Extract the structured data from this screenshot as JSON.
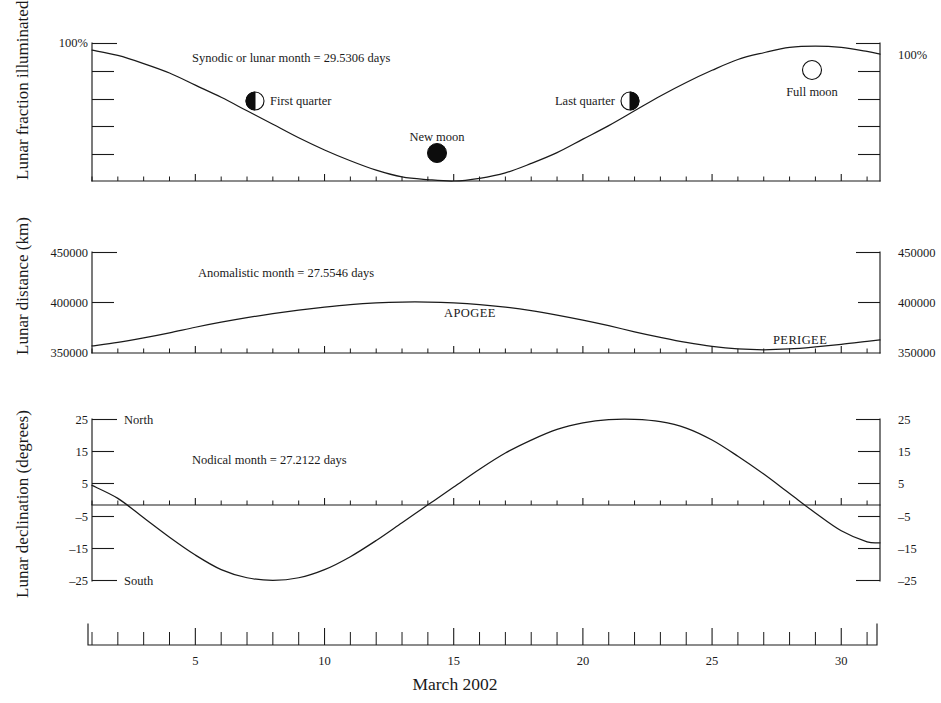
{
  "figure": {
    "xaxis_title": "March 2002",
    "x_tick_labels": [
      "5",
      "10",
      "15",
      "20",
      "25",
      "30"
    ],
    "x_tick_values": [
      5,
      10,
      15,
      20,
      25,
      30
    ]
  },
  "panels": {
    "illumination": {
      "ylabel": "Lunar fraction illuminated",
      "left_tick_label": "100%",
      "right_tick_label": "100%",
      "annotation": "Synodic or lunar month = 29.5306 days",
      "phase_markers": [
        {
          "name": "First quarter",
          "icon": "first-quarter-moon-icon"
        },
        {
          "name": "New moon",
          "icon": "new-moon-icon"
        },
        {
          "name": "Last quarter",
          "icon": "last-quarter-moon-icon"
        },
        {
          "name": "Full moon",
          "icon": "full-moon-icon"
        }
      ]
    },
    "distance": {
      "ylabel": "Lunar distance  (km)",
      "tick_labels": [
        "450000",
        "400000",
        "350000"
      ],
      "annotation": "Anomalistic month = 27.5546 days",
      "apogee_label": "APOGEE",
      "perigee_label": "PERIGEE"
    },
    "declination": {
      "ylabel": "Lunar declination (degrees)",
      "tick_labels": [
        "25",
        "15",
        "5",
        "–5",
        "–15",
        "–25"
      ],
      "north_label": "North",
      "south_label": "South",
      "annotation": "Nodical month = 27.2122 days"
    }
  },
  "chart_data": [
    {
      "type": "line",
      "id": "lunar-illumination",
      "title": "Lunar fraction illuminated",
      "xlabel": "March 2002",
      "ylabel": "Lunar fraction illuminated",
      "xlim": [
        1,
        31.5
      ],
      "ylim": [
        0,
        100
      ],
      "yticks": [
        0,
        20,
        40,
        60,
        80,
        100
      ],
      "ytick_labels": [
        "",
        "",
        "",
        "",
        "",
        "100%"
      ],
      "grid": false,
      "annotation": "Synodic or lunar month = 29.5306 days",
      "synodic_month_days": 29.5306,
      "x": [
        1,
        2,
        3,
        4,
        5,
        6,
        7,
        8,
        9,
        10,
        11,
        12,
        13,
        14,
        15,
        16,
        17,
        18,
        19,
        20,
        21,
        22,
        23,
        24,
        25,
        26,
        27,
        28,
        29,
        30,
        31,
        31.5
      ],
      "values": [
        97,
        93,
        87,
        80,
        71,
        62,
        52,
        42,
        32,
        23,
        15,
        8,
        3,
        1,
        0,
        2,
        6,
        13,
        21,
        31,
        41,
        52,
        63,
        73,
        82,
        90,
        95,
        99,
        100,
        99,
        96,
        94
      ],
      "events": [
        {
          "label": "First quarter",
          "day": 6.6,
          "fraction": 50
        },
        {
          "label": "New moon",
          "day": 14.4,
          "fraction": 0
        },
        {
          "label": "Last quarter",
          "day": 21.9,
          "fraction": 50
        },
        {
          "label": "Full moon",
          "day": 28.8,
          "fraction": 100
        }
      ]
    },
    {
      "type": "line",
      "id": "lunar-distance",
      "title": "Lunar distance (km)",
      "xlabel": "March 2002",
      "ylabel": "Lunar distance  (km)",
      "xlim": [
        1,
        31.5
      ],
      "ylim": [
        350000,
        450000
      ],
      "yticks": [
        350000,
        400000,
        450000
      ],
      "ytick_labels": [
        "350000",
        "400000",
        "450000"
      ],
      "grid": false,
      "annotation": "Anomalistic month = 27.5546 days",
      "anomalistic_month_days": 27.5546,
      "x": [
        1,
        2,
        3,
        4,
        5,
        6,
        7,
        8,
        9,
        10,
        11,
        12,
        13,
        14,
        15,
        16,
        17,
        18,
        19,
        20,
        21,
        22,
        23,
        24,
        25,
        26,
        27,
        28,
        29,
        30,
        31,
        31.5
      ],
      "values": [
        357000,
        360500,
        365000,
        370000,
        375500,
        380500,
        385000,
        389000,
        392500,
        395500,
        398000,
        399600,
        400400,
        400400,
        399600,
        398000,
        395500,
        392000,
        387500,
        382500,
        377000,
        371000,
        365500,
        360500,
        356500,
        354000,
        353200,
        354000,
        356000,
        358500,
        361500,
        363000
      ],
      "events": [
        {
          "label": "APOGEE",
          "day": 18.5,
          "value": 389000
        },
        {
          "label": "PERIGEE",
          "day": 27.2,
          "value": 353200
        }
      ]
    },
    {
      "type": "line",
      "id": "lunar-declination",
      "title": "Lunar declination (degrees)",
      "xlabel": "March 2002",
      "ylabel": "Lunar declination (degrees)",
      "xlim": [
        1,
        31.5
      ],
      "ylim": [
        -25,
        25
      ],
      "yticks": [
        -25,
        -15,
        -5,
        5,
        15,
        25
      ],
      "ytick_labels": [
        "–25",
        "–15",
        "–5",
        "5",
        "15",
        "25"
      ],
      "grid": false,
      "annotation": "Nodical month = 27.2122 days",
      "nodical_month_days": 27.2122,
      "direction_top": "North",
      "direction_bottom": "South",
      "x": [
        1,
        2,
        3,
        4,
        5,
        6,
        7,
        8,
        9,
        10,
        11,
        12,
        13,
        14,
        15,
        16,
        17,
        18,
        19,
        20,
        21,
        22,
        23,
        24,
        25,
        26,
        27,
        28,
        29,
        30,
        31,
        31.5
      ],
      "values": [
        4.5,
        0.5,
        -5.5,
        -11.5,
        -17,
        -21.5,
        -24,
        -24.8,
        -24,
        -21.5,
        -17.5,
        -12.5,
        -7,
        -1.5,
        4,
        9.5,
        14.5,
        18.5,
        21.8,
        23.8,
        24.8,
        24.9,
        24.2,
        22.2,
        18.5,
        13.5,
        8,
        2,
        -4,
        -9.5,
        -12.9,
        -13.2
      ]
    }
  ]
}
